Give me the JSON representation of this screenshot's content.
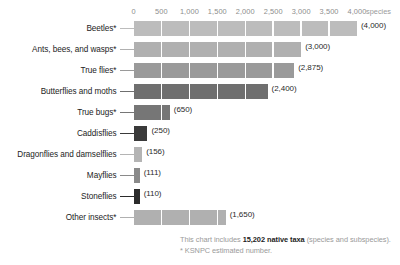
{
  "chart_data": {
    "type": "bar",
    "orientation": "horizontal",
    "title": "",
    "xlabel": "species",
    "ylabel": "",
    "xlim": [
      0,
      4000
    ],
    "grid": true,
    "legend": "none",
    "axis_position": "top",
    "tick_labels": [
      "0",
      "500",
      "1,000",
      "1,500",
      "2,000",
      "2,500",
      "3,000",
      "3,500",
      "4,000"
    ],
    "tick_values": [
      0,
      500,
      1000,
      1500,
      2000,
      2500,
      3000,
      3500,
      4000
    ],
    "unit_label": "species",
    "categories": [
      "Beetles*",
      "Ants, bees, and wasps*",
      "True flies*",
      "Butterflies and moths",
      "True bugs*",
      "Caddisflies",
      "Dragonflies and damselflies",
      "Mayflies",
      "Stoneflies",
      "Other insects*"
    ],
    "values": [
      4000,
      3000,
      2875,
      2400,
      650,
      250,
      156,
      111,
      110,
      1650
    ],
    "value_labels": [
      "(4,000)",
      "(3,000)",
      "(2,875)",
      "(2,400)",
      "(650)",
      "(250)",
      "(156)",
      "(111)",
      "(110)",
      "(1,650)"
    ],
    "bar_colors": [
      "#bcbcbc",
      "#b0b0b0",
      "#9a9a9a",
      "#6f6f6f",
      "#767676",
      "#3a3a3a",
      "#b4b4b4",
      "#8a8a8a",
      "#2b2b2b",
      "#b0b0b0"
    ]
  },
  "footnotes": {
    "line1_prefix": "This chart includes ",
    "line1_emphasis": "15,202 native taxa",
    "line1_suffix": " (species and subspecies).",
    "line2": "* KSNPC estimated number."
  }
}
